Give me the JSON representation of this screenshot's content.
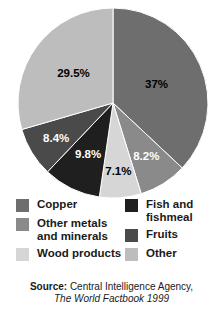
{
  "chart_data": {
    "type": "pie",
    "title": "",
    "categories": [
      "Copper",
      "Other metals and minerals",
      "Wood products",
      "Fish and fishmeal",
      "Fruits",
      "Other"
    ],
    "values": [
      37,
      8.2,
      7.1,
      9.8,
      8.4,
      29.5
    ],
    "labels": [
      "37%",
      "8.2%",
      "7.1%",
      "9.8%",
      "8.4%",
      "29.5%"
    ],
    "colors": [
      "#6e6e6e",
      "#8a8a8a",
      "#d6d6d6",
      "#1f1f1f",
      "#4a4a4a",
      "#bdbdbd"
    ],
    "label_colors": [
      "#000000",
      "#ffffff",
      "#000000",
      "#ffffff",
      "#ffffff",
      "#000000"
    ],
    "start_angle_deg": 0,
    "direction": "clockwise",
    "legend_position": "bottom",
    "grid": false,
    "xlabel": "",
    "ylabel": ""
  },
  "pie": {
    "slices": [
      {
        "name": "copper",
        "label": "37%",
        "value": 37,
        "color": "#6e6e6e",
        "label_color": "#000000"
      },
      {
        "name": "other-metals",
        "label": "8.2%",
        "value": 8.2,
        "color": "#8a8a8a",
        "label_color": "#ffffff"
      },
      {
        "name": "wood-products",
        "label": "7.1%",
        "value": 7.1,
        "color": "#d6d6d6",
        "label_color": "#000000"
      },
      {
        "name": "fish",
        "label": "9.8%",
        "value": 9.8,
        "color": "#1f1f1f",
        "label_color": "#ffffff"
      },
      {
        "name": "fruits",
        "label": "8.4%",
        "value": 8.4,
        "color": "#4a4a4a",
        "label_color": "#ffffff"
      },
      {
        "name": "other",
        "label": "29.5%",
        "value": 29.5,
        "color": "#bdbdbd",
        "label_color": "#000000"
      }
    ]
  },
  "legend": {
    "left_column": [
      {
        "label": "Copper",
        "color": "#6e6e6e"
      },
      {
        "label": "Other metals\nand minerals",
        "color": "#8a8a8a"
      },
      {
        "label": "Wood products",
        "color": "#d6d6d6"
      }
    ],
    "right_column": [
      {
        "label": "Fish and\nfishmeal",
        "color": "#1f1f1f"
      },
      {
        "label": "Fruits",
        "color": "#4a4a4a"
      },
      {
        "label": "Other",
        "color": "#bdbdbd"
      }
    ]
  },
  "source": {
    "label": "Source:",
    "line1": "Central Intelligence Agency,",
    "line2": "The World Factbook 1999"
  }
}
